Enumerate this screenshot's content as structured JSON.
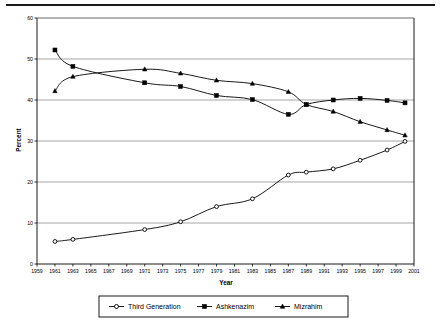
{
  "figure": {
    "has_top_rule": true,
    "background": "#ffffff",
    "line_color": "#000000",
    "grid_color": "#808080",
    "frame_color": "#000000"
  },
  "chart_data": {
    "type": "line",
    "title": "",
    "xlabel": "Year",
    "ylabel": "Percent",
    "xlim": [
      1959,
      2001
    ],
    "ylim": [
      0,
      60
    ],
    "ytick_step": 10,
    "xtick_step": 2,
    "grid": "horizontal",
    "legend_position": "bottom",
    "xticks": [
      1959,
      1961,
      1963,
      1965,
      1967,
      1969,
      1971,
      1973,
      1975,
      1977,
      1979,
      1981,
      1983,
      1985,
      1987,
      1989,
      1991,
      1993,
      1995,
      1997,
      1999,
      2001
    ],
    "yticks": [
      0,
      10,
      20,
      30,
      40,
      50,
      60
    ],
    "x": [
      1961,
      1963,
      1971,
      1975,
      1979,
      1983,
      1987,
      1989,
      1992,
      1995,
      1998,
      2000
    ],
    "series": [
      {
        "name": "Third Generation",
        "marker": "open-circle",
        "values": [
          5.5,
          6.0,
          8.4,
          10.3,
          14.0,
          15.9,
          21.7,
          22.4,
          23.2,
          25.3,
          27.8,
          29.9
        ]
      },
      {
        "name": "Ashkenazim",
        "marker": "filled-square",
        "values": [
          52.2,
          48.2,
          44.2,
          43.3,
          41.1,
          40.1,
          36.5,
          38.9,
          40.0,
          40.4,
          39.9,
          39.3
        ]
      },
      {
        "name": "Mizrahim",
        "marker": "filled-triangle",
        "values": [
          42.2,
          45.7,
          47.5,
          46.5,
          44.8,
          44.0,
          42.0,
          38.9,
          37.2,
          34.7,
          32.7,
          31.4
        ]
      }
    ]
  },
  "legend": {
    "items": [
      {
        "label": "Third Generation",
        "marker": "open-circle"
      },
      {
        "label": "Ashkenazim",
        "marker": "filled-square"
      },
      {
        "label": "Mizrahim",
        "marker": "filled-triangle"
      }
    ]
  }
}
